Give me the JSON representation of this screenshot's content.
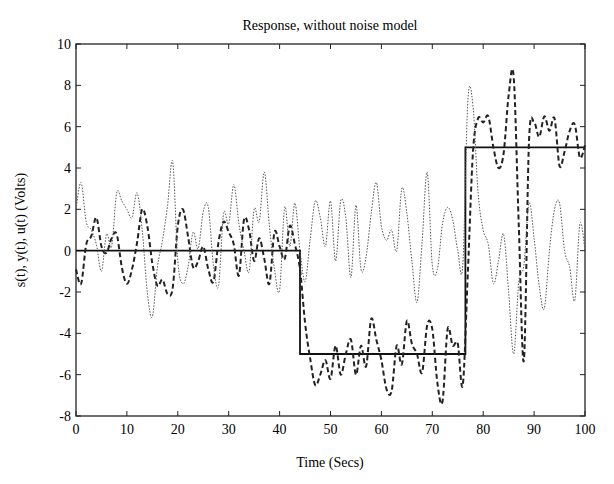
{
  "chart_data": {
    "type": "line",
    "title": "Response, without noise model",
    "xlabel": "Time (Secs)",
    "ylabel": "s(t), y(t), u(t) (Volts)",
    "xlim": [
      0,
      100
    ],
    "ylim": [
      -8,
      10
    ],
    "xticks": [
      0,
      10,
      20,
      30,
      40,
      50,
      60,
      70,
      80,
      90,
      100
    ],
    "yticks": [
      -8,
      -6,
      -4,
      -2,
      0,
      2,
      4,
      6,
      8,
      10
    ],
    "grid": false,
    "legend": null,
    "series": [
      {
        "name": "s(t)",
        "style": "solid",
        "x": [
          0,
          44,
          44,
          76.5,
          76.5,
          100
        ],
        "y": [
          0,
          0,
          -5,
          -5,
          5,
          5
        ]
      },
      {
        "name": "y(t)",
        "style": "dashed",
        "x": [
          0,
          1,
          2,
          3,
          4,
          5,
          6,
          7,
          8,
          9,
          10,
          11,
          12,
          13,
          14,
          15,
          16,
          17,
          18,
          19,
          20,
          21,
          22,
          23,
          24,
          25,
          26,
          27,
          28,
          29,
          30,
          31,
          32,
          33,
          34,
          35,
          36,
          37,
          38,
          39,
          40,
          41,
          42,
          43,
          44,
          45,
          46,
          47,
          48,
          49,
          50,
          51,
          52,
          53,
          54,
          55,
          56,
          57,
          58,
          59,
          60,
          61,
          62,
          63,
          64,
          65,
          66,
          67,
          68,
          69,
          70,
          71,
          72,
          73,
          74,
          75,
          76,
          77,
          78,
          79,
          80,
          81,
          82,
          83,
          84,
          85,
          86,
          87,
          88,
          89,
          90,
          91,
          92,
          93,
          94,
          95,
          96,
          97,
          98,
          99,
          100
        ],
        "y": [
          -0.9,
          -1.6,
          0.3,
          0.7,
          1.6,
          0.2,
          -0.1,
          0.6,
          0.8,
          -0.8,
          -1.6,
          -0.9,
          0.4,
          2.0,
          1.2,
          -0.6,
          -1.7,
          -1.4,
          -2.1,
          -1.8,
          1.2,
          2.0,
          0.7,
          -0.8,
          -0.5,
          0.2,
          -0.9,
          -1.5,
          0.4,
          1.4,
          0.9,
          0.3,
          -1.2,
          1.5,
          1.0,
          -0.5,
          0.6,
          -0.4,
          -1.6,
          0.9,
          0.2,
          -0.4,
          1.2,
          0.3,
          -0.9,
          -3.5,
          -5.2,
          -6.5,
          -6.0,
          -5.3,
          -6.2,
          -4.6,
          -6.0,
          -5.0,
          -4.3,
          -6.0,
          -4.6,
          -5.6,
          -3.3,
          -4.3,
          -5.3,
          -6.7,
          -6.8,
          -4.6,
          -5.5,
          -3.4,
          -4.5,
          -5.0,
          -5.9,
          -3.6,
          -3.8,
          -6.4,
          -7.3,
          -3.8,
          -4.6,
          -4.5,
          -6.5,
          -1.0,
          4.8,
          6.4,
          6.2,
          6.5,
          5.0,
          4.0,
          4.7,
          7.5,
          8.4,
          1.2,
          -5.3,
          5.3,
          6.2,
          5.5,
          6.5,
          5.8,
          6.4,
          4.1,
          4.8,
          5.8,
          6.1,
          4.5,
          5.1
        ]
      },
      {
        "name": "u(t)",
        "style": "dotted",
        "x": [
          0,
          1,
          2,
          3,
          4,
          5,
          6,
          7,
          8,
          9,
          10,
          11,
          12,
          13,
          14,
          15,
          16,
          17,
          18,
          19,
          20,
          21,
          22,
          23,
          24,
          25,
          26,
          27,
          28,
          29,
          30,
          31,
          32,
          33,
          34,
          35,
          36,
          37,
          38,
          39,
          40,
          41,
          42,
          43,
          44,
          45,
          46,
          47,
          48,
          49,
          50,
          51,
          52,
          53,
          54,
          55,
          56,
          57,
          58,
          59,
          60,
          61,
          62,
          63,
          64,
          65,
          66,
          67,
          68,
          69,
          70,
          71,
          72,
          73,
          74,
          75,
          76,
          77,
          78,
          79,
          80,
          81,
          82,
          83,
          84,
          85,
          86,
          87,
          88,
          89,
          90,
          91,
          92,
          93,
          94,
          95,
          96,
          97,
          98,
          99,
          100
        ],
        "y": [
          2.0,
          3.3,
          1.4,
          1.0,
          0.3,
          -1.0,
          0.8,
          0.2,
          2.8,
          2.4,
          2.0,
          1.6,
          2.8,
          1.0,
          -2.0,
          -3.2,
          -0.8,
          0.5,
          2.2,
          4.3,
          -0.5,
          -1.6,
          -0.8,
          0.9,
          0.1,
          1.9,
          2.1,
          -0.7,
          -1.7,
          1.8,
          1.3,
          3.2,
          1.3,
          0.0,
          -1.0,
          2.0,
          1.4,
          3.8,
          1.2,
          -0.9,
          -1.9,
          2.1,
          0.2,
          2.3,
          0.0,
          -1.5,
          0.5,
          2.4,
          1.6,
          0.2,
          2.4,
          -0.5,
          2.4,
          1.6,
          -1.3,
          2.2,
          -0.9,
          -0.3,
          1.8,
          3.3,
          1.2,
          0.5,
          1.0,
          0.0,
          3.0,
          1.8,
          -0.5,
          -2.5,
          0.4,
          3.8,
          -0.7,
          -0.9,
          1.3,
          2.1,
          1.5,
          0.0,
          -0.7,
          7.3,
          7.0,
          2.8,
          1.0,
          0.3,
          -1.6,
          -0.5,
          0.8,
          -2.0,
          -5.0,
          -1.5,
          -0.7,
          2.3,
          0.6,
          -1.7,
          -2.8,
          0.0,
          2.0,
          2.3,
          0.0,
          -0.8,
          -2.4,
          1.3,
          0.0
        ]
      }
    ]
  }
}
